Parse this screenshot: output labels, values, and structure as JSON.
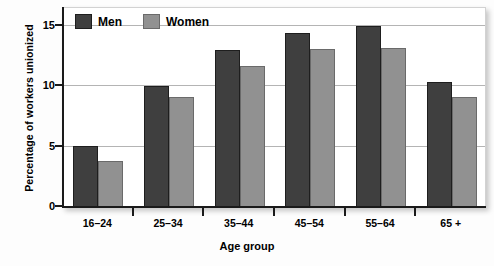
{
  "chart_data": {
    "type": "bar",
    "title": "",
    "xlabel": "Age group",
    "ylabel": "Percentage of workers unionized",
    "categories": [
      "16–24",
      "25–34",
      "35–44",
      "45–54",
      "55–64",
      "65 +"
    ],
    "series": [
      {
        "name": "Men",
        "color": "#3f3f3f",
        "values": [
          5.1,
          10.0,
          13.0,
          14.4,
          15.0,
          10.4
        ]
      },
      {
        "name": "Women",
        "color": "#919191",
        "values": [
          3.8,
          9.1,
          11.7,
          13.1,
          13.2,
          9.1
        ]
      }
    ],
    "ylim": [
      0,
      16.5
    ],
    "yticks": [
      0,
      5,
      10,
      15
    ],
    "ytick_labels": [
      "0",
      "5",
      "10",
      "15"
    ],
    "grid": true,
    "grid_axis": "y",
    "legend_position": "top-left"
  },
  "legend": {
    "items": [
      {
        "label": "Men",
        "swatch": "men-swatch"
      },
      {
        "label": "Women",
        "swatch": "women-swatch"
      }
    ]
  }
}
